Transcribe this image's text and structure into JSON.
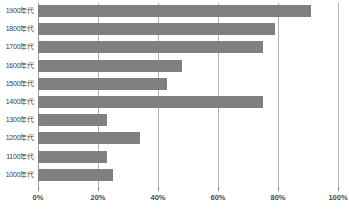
{
  "chart_data": {
    "type": "bar",
    "orientation": "horizontal",
    "title": "",
    "xlabel": "",
    "ylabel": "",
    "categories": [
      "1900年代",
      "1800年代",
      "1700年代",
      "1600年代",
      "1500年代",
      "1400年代",
      "1300年代",
      "1200年代",
      "1100年代",
      "1000年代"
    ],
    "values": [
      91,
      79,
      75,
      48,
      43,
      75,
      23,
      34,
      23,
      25
    ],
    "xlim": [
      0,
      100
    ],
    "x_ticks": [
      0,
      20,
      40,
      60,
      80,
      100
    ],
    "x_tick_labels": [
      "0%",
      "20%",
      "40%",
      "60%",
      "80%",
      "100%"
    ],
    "grid": true,
    "grid_axis": "x",
    "legend": false,
    "bar_color": "#808080",
    "gridline_color": "#b3b3b3",
    "axis_color": "#9a9a9a",
    "label_color": "#404040",
    "background_color": "#ffffff"
  }
}
